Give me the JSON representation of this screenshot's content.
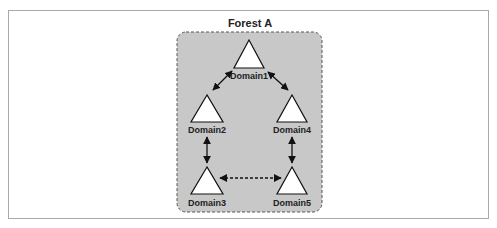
{
  "diagram": {
    "title": "Forest A",
    "colors": {
      "forest_fill": "#c8c8c8",
      "forest_border": "#555555",
      "triangle_fill": "#ffffff",
      "stroke": "#111111",
      "frame": "#a9a9a9"
    },
    "domains": [
      {
        "id": "domain1",
        "label": "Domain1"
      },
      {
        "id": "domain2",
        "label": "Domain2"
      },
      {
        "id": "domain3",
        "label": "Domain3"
      },
      {
        "id": "domain4",
        "label": "Domain4"
      },
      {
        "id": "domain5",
        "label": "Domain5"
      }
    ],
    "relationships": [
      {
        "from": "Domain1",
        "to": "Domain2",
        "type": "two-way",
        "style": "solid"
      },
      {
        "from": "Domain1",
        "to": "Domain4",
        "type": "two-way",
        "style": "solid"
      },
      {
        "from": "Domain2",
        "to": "Domain3",
        "type": "two-way",
        "style": "solid"
      },
      {
        "from": "Domain4",
        "to": "Domain5",
        "type": "two-way",
        "style": "solid"
      },
      {
        "from": "Domain3",
        "to": "Domain5",
        "type": "two-way",
        "style": "dashed"
      }
    ]
  }
}
